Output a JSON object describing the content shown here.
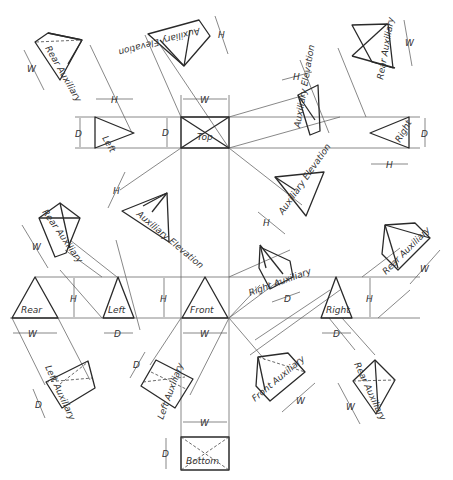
{
  "figure": {
    "type": "orthographic-projection-diagram"
  },
  "views": {
    "top": "Top",
    "front": "Front",
    "rear": "Rear",
    "left": "Left",
    "right": "Right",
    "bottom": "Bottom",
    "aux_elev_top": "Auxiliary Elevation",
    "aux_elev_upper_right": "Auxiliary Elevation",
    "aux_elev_lower_left": "Auxiliary Elevation",
    "aux_elev_lower_right": "Auxiliary Elevation",
    "rear_aux_upper_left": "Rear Auxiliary",
    "rear_aux_upper_right": "Rear Auxiliary",
    "rear_aux_mid_left": "Rear Auxiliary",
    "rear_aux_mid_right": "Rear Auxiliary",
    "rear_aux_lower_right": "Rear Auxiliary",
    "right_aux": "Right Auxiliary",
    "left_aux_a": "Left Auxiliary",
    "left_aux_b": "Left Auxiliary",
    "front_aux": "Front Auxiliary"
  },
  "dims": {
    "W": "W",
    "H": "H",
    "D": "D"
  }
}
